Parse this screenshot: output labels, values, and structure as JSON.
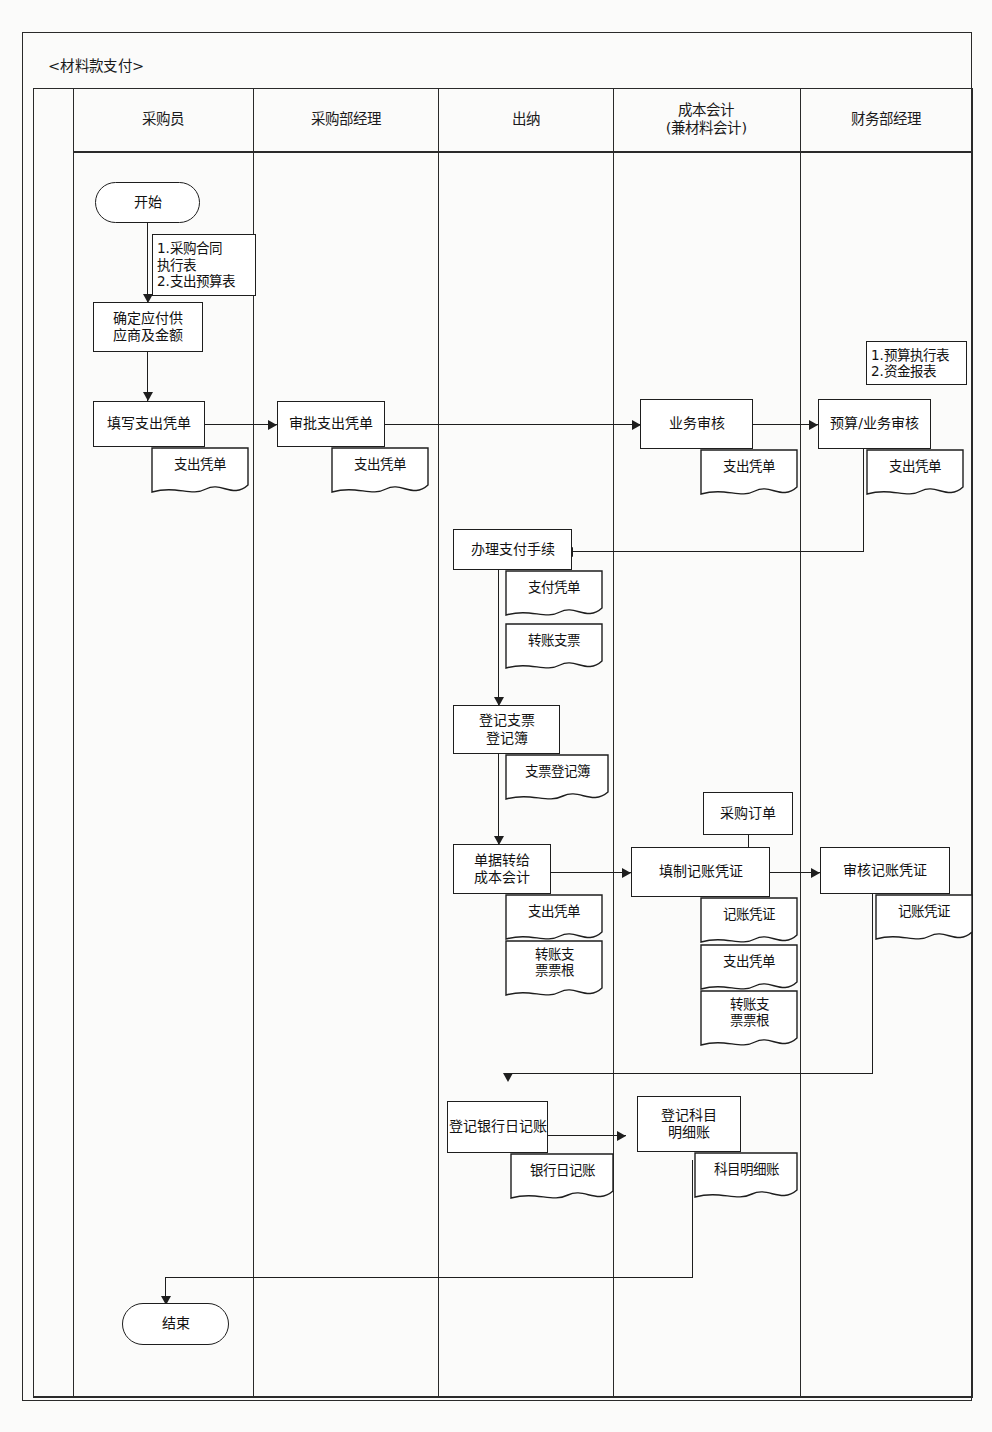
{
  "diagram": {
    "title": "<材料款支付>",
    "type": "cross-functional-flowchart",
    "lanes": [
      {
        "id": "lane-blank",
        "label": ""
      },
      {
        "id": "lane-buyer",
        "label": "采购员"
      },
      {
        "id": "lane-purchasing-manager",
        "label": "采购部经理"
      },
      {
        "id": "lane-cashier",
        "label": "出纳"
      },
      {
        "id": "lane-cost-accountant",
        "label": "成本会计\n(兼材料会计)"
      },
      {
        "id": "lane-finance-manager",
        "label": "财务部经理"
      }
    ],
    "nodes": {
      "start": "开始",
      "determine_supplier": "确定应付供\n应商及金额",
      "fill_payment_voucher": "填写支出凭单",
      "approve_payment_voucher": "审批支出凭单",
      "business_review": "业务审核",
      "budget_business_review": "预算/业务审核",
      "process_payment": "办理支付手续",
      "register_check_book": "登记支票\n登记簿",
      "transfer_docs_to_cost_accountant": "单据转给\n成本会计",
      "prepare_accounting_voucher": "填制记账凭证",
      "audit_accounting_voucher": "审核记账凭证",
      "register_bank_journal": "登记银行日记账",
      "register_subsidiary_ledger": "登记科目\n明细账",
      "end": "结束"
    },
    "notes": {
      "purchase_contract_note": "1.采购合同\n执行表\n2.支出预算表",
      "budget_report_note": "1.预算执行表\n2.资金报表"
    },
    "documents": {
      "payment_voucher_buyer": "支出凭单",
      "payment_voucher_manager": "支出凭单",
      "payment_voucher_cost": "支出凭单",
      "payment_voucher_finance": "支出凭单",
      "payment_slip": "支付凭单",
      "transfer_check": "转账支票",
      "check_register_book": "支票登记簿",
      "purchase_order": "采购订单",
      "payment_voucher_transfer": "支出凭单",
      "transfer_check_stub_cashier": "转账支\n票票根",
      "accounting_voucher_prepared": "记账凭证",
      "payment_voucher_prepared": "支出凭单",
      "transfer_check_stub_cost": "转账支\n票票根",
      "accounting_voucher_audited": "记账凭证",
      "bank_journal": "银行日记账",
      "subsidiary_ledger": "科目明细账"
    },
    "colors": {
      "line": "#1e1e1e",
      "background": "#fbfbfa",
      "text": "#111111"
    }
  }
}
